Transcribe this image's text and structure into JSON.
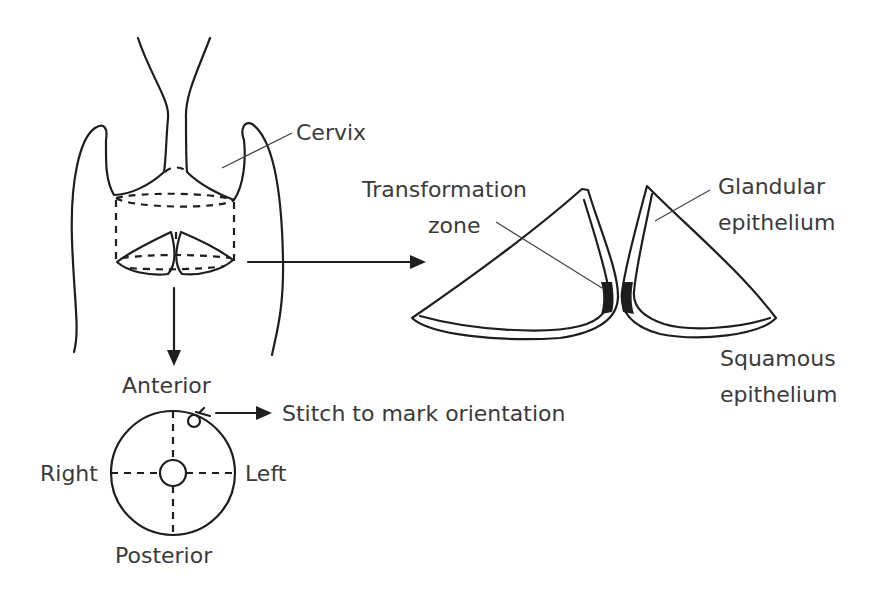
{
  "diagram": {
    "type": "anatomical-illustration",
    "labels": {
      "cervix": "Cervix",
      "transformation_zone_1": "Transformation",
      "transformation_zone_2": "zone",
      "glandular_1": "Glandular",
      "glandular_2": "epithelium",
      "squamous_1": "Squamous",
      "squamous_2": "epithelium",
      "anterior": "Anterior",
      "posterior": "Posterior",
      "right": "Right",
      "left": "Left",
      "stitch": "Stitch to mark orientation"
    },
    "colors": {
      "line": "#1e1e1e",
      "text": "#3a3a3a",
      "background": "#ffffff"
    }
  }
}
